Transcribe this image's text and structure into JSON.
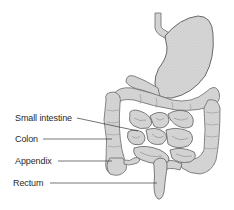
{
  "diagram": {
    "labels": [
      {
        "id": "small-intestine",
        "text": "Small intestine",
        "x": 15,
        "y": 113,
        "line": {
          "x1": 77,
          "y1": 118,
          "x2": 138,
          "y2": 131
        }
      },
      {
        "id": "colon",
        "text": "Colon",
        "x": 15,
        "y": 134,
        "line": {
          "x1": 43,
          "y1": 139,
          "x2": 112,
          "y2": 139
        }
      },
      {
        "id": "appendix",
        "text": "Appendix",
        "x": 15,
        "y": 156,
        "line": {
          "x1": 58,
          "y1": 161,
          "x2": 112,
          "y2": 161
        }
      },
      {
        "id": "rectum",
        "text": "Rectum",
        "x": 13,
        "y": 178,
        "line": {
          "x1": 50,
          "y1": 183,
          "x2": 157,
          "y2": 183
        }
      }
    ],
    "colors": {
      "organ_fill": "#d4d4d4",
      "organ_stroke": "#6a6a6a",
      "leader_line": "#3a3a3a",
      "label_text": "#2a2a2a",
      "background": "#ffffff"
    }
  }
}
